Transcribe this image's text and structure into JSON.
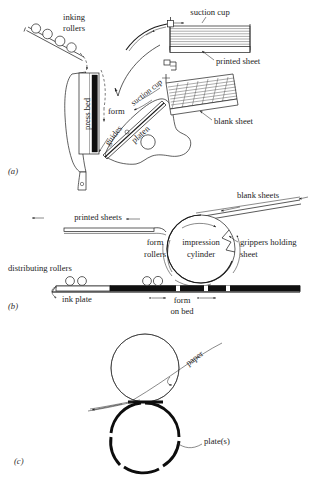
{
  "figure": {
    "type": "technical-line-diagram",
    "panels": [
      {
        "id": "a",
        "id_label": "(a)",
        "name": "platen-press",
        "labels": [
          {
            "key": "inking_rollers",
            "text_line1": "inking",
            "text_line2": "rollers"
          },
          {
            "key": "suction_cup_top",
            "text": "suction cup"
          },
          {
            "key": "printed_sheet",
            "text": "printed sheet"
          },
          {
            "key": "blank_sheet",
            "text": "blank sheet"
          },
          {
            "key": "suction_cup_rotated",
            "text": "suction cup"
          },
          {
            "key": "press_bed",
            "text": "press bed"
          },
          {
            "key": "form",
            "text": "form"
          },
          {
            "key": "guides",
            "text": "guides"
          },
          {
            "key": "platen",
            "text": "platen"
          }
        ]
      },
      {
        "id": "b",
        "id_label": "(b)",
        "name": "flatbed-cylinder-press",
        "labels": [
          {
            "key": "blank_sheets",
            "text": "blank sheets"
          },
          {
            "key": "printed_sheets",
            "text": "printed sheets"
          },
          {
            "key": "form_rollers",
            "text_line1": "form",
            "text_line2": "rollers"
          },
          {
            "key": "impression_cylinder",
            "text_line1": "impression",
            "text_line2": "cylinder"
          },
          {
            "key": "grippers_holding_sheet",
            "text_line1": "grippers holding",
            "text_line2": "sheet"
          },
          {
            "key": "distributing_rollers",
            "text": "distributing rollers"
          },
          {
            "key": "ink_plate",
            "text": "ink plate"
          },
          {
            "key": "form_on_bed",
            "text_line1": "form",
            "text_line2": "on bed"
          }
        ]
      },
      {
        "id": "c",
        "id_label": "(c)",
        "name": "rotary-plate-cylinder",
        "labels": [
          {
            "key": "paper",
            "text": "paper"
          },
          {
            "key": "plates",
            "text": "plate(s)"
          }
        ]
      }
    ],
    "colors": {
      "background": "#ffffff",
      "ink": "#1d1d1d",
      "line": "#232323",
      "heavy": "#0d0d0d"
    }
  }
}
